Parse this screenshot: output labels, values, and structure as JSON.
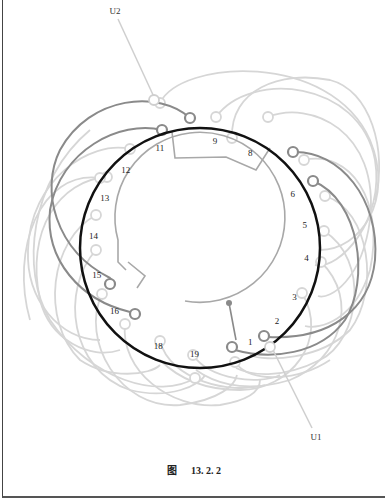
{
  "figure": {
    "caption_prefix": "图",
    "caption_number": "13. 2. 2"
  },
  "diagram": {
    "type": "winding-diagram",
    "slot_count": 19,
    "slot_labels": [
      "1",
      "2",
      "3",
      "4",
      "5",
      "6",
      "8",
      "9",
      "11",
      "12",
      "13",
      "14",
      "15",
      "16",
      "18",
      "19"
    ],
    "terminals": [
      {
        "id": "U1",
        "label": "U1"
      },
      {
        "id": "U2",
        "label": "U2"
      }
    ],
    "colors": {
      "stator_ring": "#111111",
      "active_coil": "#8a8a8a",
      "inactive_coil": "#d6d6d6",
      "inner_conductor": "#a8a8a8",
      "terminal_lead": "#cfcfcf"
    }
  }
}
